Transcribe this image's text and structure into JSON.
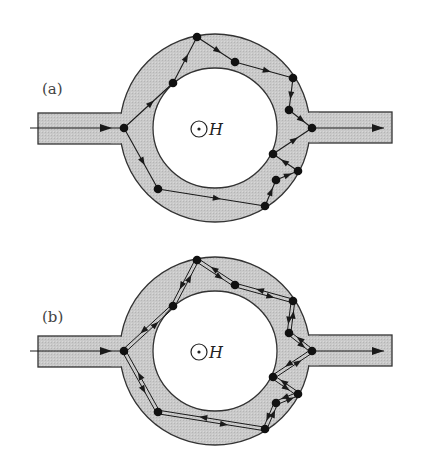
{
  "figure": {
    "colors": {
      "conductor_fill": "#c8c8c8",
      "outline": "#333333",
      "path": "#1a1a1a",
      "node": "#111111",
      "background": "#ffffff"
    },
    "field_symbol": "H",
    "panels": [
      {
        "label": "(a)",
        "description": "single directed paths",
        "offset_y": 0,
        "path_style": "single"
      },
      {
        "label": "(b)",
        "description": "time-reversed path pairs",
        "offset_y": 223,
        "path_style": "double"
      }
    ],
    "geometry": {
      "ring_center": [
        215,
        128
      ],
      "outer_radius": [
        95,
        94
      ],
      "inner_radius": [
        62,
        60
      ],
      "left_lead": {
        "x1": 38,
        "x2": 125,
        "y1": 113,
        "y2": 144
      },
      "right_lead": {
        "x1": 305,
        "x2": 392,
        "y1": 112,
        "y2": 143
      },
      "field_center": [
        199,
        129
      ]
    },
    "nodes": [
      [
        124,
        128
      ],
      [
        173,
        83
      ],
      [
        197,
        37
      ],
      [
        235,
        62
      ],
      [
        293,
        78
      ],
      [
        289,
        110
      ],
      [
        312,
        128
      ],
      [
        273,
        154
      ],
      [
        298,
        171
      ],
      [
        276,
        180
      ],
      [
        265,
        206
      ],
      [
        158,
        189
      ]
    ],
    "segments": [
      [
        0,
        1
      ],
      [
        1,
        2
      ],
      [
        2,
        3
      ],
      [
        3,
        4
      ],
      [
        4,
        5
      ],
      [
        5,
        6
      ],
      [
        0,
        11
      ],
      [
        11,
        10
      ],
      [
        10,
        9
      ],
      [
        9,
        8
      ],
      [
        8,
        7
      ],
      [
        7,
        6
      ]
    ],
    "input_arrow": {
      "from": [
        30,
        128
      ],
      "to": [
        124,
        128
      ]
    },
    "output_arrow": {
      "from": [
        312,
        128
      ],
      "to": [
        384,
        128
      ]
    }
  }
}
